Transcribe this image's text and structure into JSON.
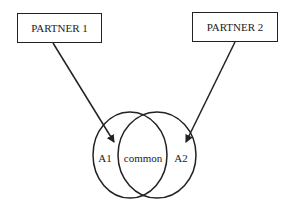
{
  "diagram": {
    "partners": [
      {
        "label": "PARTNER 1"
      },
      {
        "label": "PARTNER 2"
      }
    ],
    "sets": [
      {
        "label": "A1"
      },
      {
        "label": "common"
      },
      {
        "label": "A2"
      }
    ],
    "stroke_color": "#222222"
  }
}
